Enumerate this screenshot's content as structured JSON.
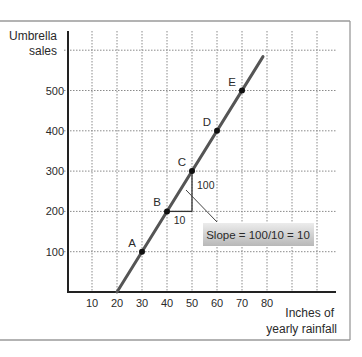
{
  "chart_data": {
    "type": "line",
    "title": "",
    "xlabel": "Inches of yearly rainfall",
    "xlabel_lines": [
      "Inches of",
      "yearly rainfall"
    ],
    "ylabel": "Umbrella sales",
    "ylabel_lines": [
      "Umbrella",
      "sales"
    ],
    "x_ticks": [
      10,
      20,
      30,
      40,
      50,
      60,
      70,
      80
    ],
    "y_ticks": [
      100,
      200,
      300,
      400,
      500
    ],
    "x_gridlines": [
      10,
      20,
      30,
      40,
      50,
      60,
      70,
      80,
      90,
      100
    ],
    "y_gridlines": [
      100,
      200,
      300,
      400,
      500,
      600
    ],
    "xlim": [
      0,
      108
    ],
    "ylim": [
      0,
      640
    ],
    "grid": true,
    "grid_style": "dotted",
    "legend": null,
    "series": [
      {
        "name": "Umbrella sales vs rainfall",
        "line": {
          "x_start": 20,
          "y_start": 0,
          "x_end": 78.4,
          "y_end": 584
        },
        "color": "#555555"
      }
    ],
    "points": [
      {
        "label": "A",
        "x": 30,
        "y": 100
      },
      {
        "label": "B",
        "x": 40,
        "y": 200
      },
      {
        "label": "C",
        "x": 50,
        "y": 300
      },
      {
        "label": "D",
        "x": 60,
        "y": 400
      },
      {
        "label": "E",
        "x": 70,
        "y": 500
      }
    ],
    "annotations": {
      "slope_triangle": {
        "from_point": "B",
        "to_point": "C",
        "run_label": "10",
        "rise_label": "100"
      },
      "callout": "Slope = 100/10 = 10"
    }
  },
  "colors": {
    "line": "#555555",
    "axis": "#222222",
    "grid": "#8a8a8a",
    "frame": "#9a9a9a",
    "callout_bg_light": "#e6e6e6",
    "callout_bg_dark": "#b4b4b4"
  }
}
